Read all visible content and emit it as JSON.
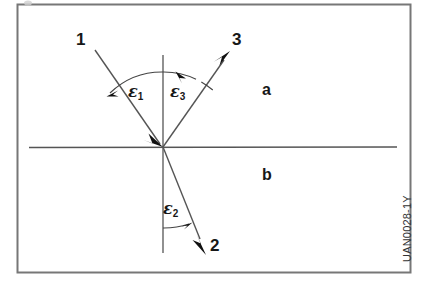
{
  "figure": {
    "caption_code": "UAN0028-1Y",
    "background_color": "#ffffff",
    "line_color": "#4d4d4d",
    "frame_color": "#6b6b6b",
    "text_color": "#171717",
    "labels": {
      "ray1": "1",
      "ray2": "2",
      "ray3": "3",
      "medium_upper": "a",
      "medium_lower": "b",
      "angle1": "ε",
      "angle1_sub": "1",
      "angle2": "ε",
      "angle2_sub": "2",
      "angle3": "ε",
      "angle3_sub": "3"
    },
    "geometry": {
      "origin_x": 163,
      "origin_y": 147,
      "interface_x1": 29,
      "interface_x2": 397,
      "normal_y_top": 55,
      "normal_y_bottom": 253,
      "ray1_start_x": 95,
      "ray1_start_y": 50,
      "ray3_end_x": 228,
      "ray3_end_y": 53,
      "ray2_end_x": 206,
      "ray2_end_y": 252
    }
  }
}
